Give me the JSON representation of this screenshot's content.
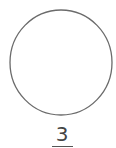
{
  "figure": {
    "shape": "circle",
    "stroke_color": "#6b6b6b",
    "fill_color": "#ffffff",
    "label": "3",
    "label_underlined": true,
    "label_color": "#444444"
  }
}
